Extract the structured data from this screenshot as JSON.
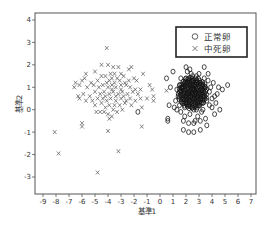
{
  "chart_data": {
    "type": "scatter",
    "title": "",
    "xlabel": "基準1",
    "ylabel": "基準2",
    "xlim": [
      -9.6,
      7.3
    ],
    "ylim": [
      -3.8,
      4.1
    ],
    "xticks": [
      -9,
      -8,
      -7,
      -6,
      -5,
      -4,
      -3,
      -2,
      -1,
      0,
      1,
      2,
      3,
      4,
      5,
      6,
      7
    ],
    "yticks": [
      4,
      3,
      2,
      1,
      0,
      -1,
      -2,
      -3
    ],
    "grid": false,
    "legend_position": "top-right",
    "series": [
      {
        "name": "正常卵",
        "marker": "circle",
        "color": "#1a1a1a",
        "points": [
          [
            2.2,
            0.8
          ],
          [
            2.5,
            0.7
          ],
          [
            2.8,
            0.9
          ],
          [
            2.0,
            0.6
          ],
          [
            2.4,
            1.0
          ],
          [
            2.6,
            0.5
          ],
          [
            3.0,
            0.7
          ],
          [
            1.9,
            0.9
          ],
          [
            2.3,
            0.4
          ],
          [
            2.7,
            1.1
          ],
          [
            2.1,
            1.2
          ],
          [
            3.2,
            0.9
          ],
          [
            1.8,
            0.5
          ],
          [
            2.9,
            0.3
          ],
          [
            2.5,
            1.3
          ],
          [
            3.4,
            0.6
          ],
          [
            1.6,
            0.8
          ],
          [
            2.2,
            0.2
          ],
          [
            3.1,
            1.2
          ],
          [
            2.0,
            1.4
          ],
          [
            2.6,
            0.0
          ],
          [
            3.5,
            1.0
          ],
          [
            1.5,
            1.1
          ],
          [
            2.4,
            1.6
          ],
          [
            3.3,
            0.3
          ],
          [
            1.7,
            0.3
          ],
          [
            2.8,
            1.5
          ],
          [
            3.6,
            0.4
          ],
          [
            1.4,
            0.6
          ],
          [
            2.3,
            -0.2
          ],
          [
            2.9,
            -0.3
          ],
          [
            3.8,
            0.8
          ],
          [
            1.3,
            0.9
          ],
          [
            2.1,
            1.7
          ],
          [
            3.7,
            1.3
          ],
          [
            1.6,
            1.4
          ],
          [
            2.7,
            -0.5
          ],
          [
            4.0,
            0.5
          ],
          [
            1.2,
            0.4
          ],
          [
            3.0,
            1.6
          ],
          [
            3.9,
            1.0
          ],
          [
            4.2,
            0.6
          ],
          [
            4.4,
            0.7
          ],
          [
            4.5,
            1.0
          ],
          [
            4.1,
            1.2
          ],
          [
            4.6,
            0.0
          ],
          [
            5.2,
            1.1
          ],
          [
            4.8,
            0.9
          ],
          [
            3.7,
            1.6
          ],
          [
            3.4,
            1.9
          ],
          [
            2.3,
            1.8
          ],
          [
            2.0,
            1.9
          ],
          [
            1.0,
            1.7
          ],
          [
            0.5,
            1.4
          ],
          [
            0.8,
            1.0
          ],
          [
            0.7,
            0.2
          ],
          [
            1.1,
            0.1
          ],
          [
            1.3,
            0.0
          ],
          [
            1.6,
            -0.1
          ],
          [
            1.9,
            -0.3
          ],
          [
            1.8,
            -0.5
          ],
          [
            2.2,
            -0.6
          ],
          [
            2.6,
            -0.6
          ],
          [
            3.1,
            -0.5
          ],
          [
            3.5,
            -0.4
          ],
          [
            3.2,
            -0.1
          ],
          [
            3.6,
            -0.7
          ],
          [
            3.1,
            -0.9
          ],
          [
            2.6,
            -1.0
          ],
          [
            2.2,
            -1.0
          ],
          [
            1.8,
            -0.9
          ],
          [
            0.6,
            -0.4
          ],
          [
            0.6,
            -0.5
          ],
          [
            4.0,
            0.1
          ],
          [
            3.8,
            0.2
          ],
          [
            4.3,
            0.3
          ],
          [
            4.2,
            -0.2
          ],
          [
            3.3,
            0.0
          ],
          [
            1.5,
            0.2
          ],
          [
            1.9,
            0.1
          ],
          [
            2.5,
            0.1
          ],
          [
            2.8,
            0.0
          ],
          [
            3.0,
            0.2
          ],
          [
            2.4,
            0.6
          ],
          [
            2.6,
            0.9
          ],
          [
            2.1,
            0.7
          ],
          [
            2.9,
            0.6
          ],
          [
            2.3,
            1.1
          ],
          [
            2.7,
            0.8
          ],
          [
            3.1,
            0.5
          ],
          [
            1.9,
            1.2
          ],
          [
            2.5,
            1.5
          ],
          [
            3.3,
            1.1
          ],
          [
            2.0,
            0.3
          ],
          [
            2.8,
            1.2
          ],
          [
            3.4,
            1.4
          ],
          [
            1.7,
            1.0
          ],
          [
            2.2,
            1.4
          ],
          [
            -1.7,
            -0.1
          ]
        ]
      },
      {
        "name": "中死卵",
        "marker": "x",
        "color": "#555555",
        "points": [
          [
            -4.1,
            2.75
          ],
          [
            -4.5,
            2.0
          ],
          [
            -4.0,
            2.0
          ],
          [
            -3.6,
            1.9
          ],
          [
            -3.2,
            1.9
          ],
          [
            -2.2,
            1.9
          ],
          [
            -2.4,
            1.8
          ],
          [
            -5.0,
            1.7
          ],
          [
            -3.8,
            1.6
          ],
          [
            -3.5,
            1.6
          ],
          [
            -3.0,
            1.6
          ],
          [
            -2.8,
            1.5
          ],
          [
            -1.3,
            1.6
          ],
          [
            -5.7,
            1.6
          ],
          [
            -6.0,
            1.3
          ],
          [
            -5.8,
            1.4
          ],
          [
            -4.5,
            1.5
          ],
          [
            -4.2,
            1.5
          ],
          [
            -3.9,
            1.3
          ],
          [
            -3.3,
            1.4
          ],
          [
            -2.0,
            1.4
          ],
          [
            -1.8,
            1.3
          ],
          [
            -6.5,
            1.2
          ],
          [
            -6.6,
            1.0
          ],
          [
            -6.2,
            1.1
          ],
          [
            -5.6,
            1.0
          ],
          [
            -5.1,
            1.1
          ],
          [
            -4.7,
            1.0
          ],
          [
            -4.4,
            1.1
          ],
          [
            -4.0,
            1.0
          ],
          [
            -3.7,
            1.1
          ],
          [
            -3.4,
            1.0
          ],
          [
            -3.0,
            1.1
          ],
          [
            -2.6,
            1.1
          ],
          [
            -2.3,
            1.0
          ],
          [
            -1.9,
            0.9
          ],
          [
            -1.5,
            0.9
          ],
          [
            -0.8,
            1.1
          ],
          [
            -5.9,
            0.7
          ],
          [
            -5.4,
            0.6
          ],
          [
            -5.0,
            0.8
          ],
          [
            -4.6,
            0.7
          ],
          [
            -4.3,
            0.8
          ],
          [
            -3.9,
            0.7
          ],
          [
            -3.6,
            0.8
          ],
          [
            -3.2,
            0.7
          ],
          [
            -2.9,
            0.8
          ],
          [
            -2.5,
            0.7
          ],
          [
            -2.1,
            0.8
          ],
          [
            -1.7,
            0.7
          ],
          [
            -6.2,
            0.5
          ],
          [
            -5.7,
            0.4
          ],
          [
            -5.2,
            0.4
          ],
          [
            -4.8,
            0.5
          ],
          [
            -4.4,
            0.5
          ],
          [
            -4.1,
            0.4
          ],
          [
            -3.8,
            0.5
          ],
          [
            -3.4,
            0.4
          ],
          [
            -3.0,
            0.5
          ],
          [
            -2.6,
            0.4
          ],
          [
            -2.3,
            0.5
          ],
          [
            -1.9,
            0.4
          ],
          [
            -1.5,
            0.5
          ],
          [
            -1.0,
            0.5
          ],
          [
            -0.5,
            0.6
          ],
          [
            -0.5,
            0.4
          ],
          [
            -0.6,
            0.9
          ],
          [
            -5.0,
            0.2
          ],
          [
            -4.5,
            0.3
          ],
          [
            -3.9,
            0.2
          ],
          [
            -3.5,
            0.2
          ],
          [
            -3.1,
            0.2
          ],
          [
            -2.7,
            0.3
          ],
          [
            -2.2,
            0.2
          ],
          [
            -1.4,
            0.1
          ],
          [
            -4.9,
            -0.1
          ],
          [
            -4.6,
            -0.1
          ],
          [
            -4.3,
            -0.1
          ],
          [
            -4.0,
            -0.2
          ],
          [
            -3.7,
            -0.3
          ],
          [
            -3.3,
            -0.1
          ],
          [
            -3.9,
            -0.4
          ],
          [
            -4.2,
            0.1
          ],
          [
            -3.6,
            0.0
          ],
          [
            -2.9,
            0.0
          ],
          [
            -3.7,
            1.4
          ],
          [
            -3.1,
            1.3
          ],
          [
            -2.7,
            1.2
          ],
          [
            -4.8,
            1.3
          ],
          [
            -4.1,
            1.2
          ],
          [
            -3.5,
            1.2
          ],
          [
            -2.4,
            1.3
          ],
          [
            -5.3,
            1.2
          ],
          [
            -6.3,
            0.6
          ],
          [
            -3.4,
            0.6
          ],
          [
            -2.8,
            0.6
          ],
          [
            -4.2,
            0.6
          ],
          [
            -3.7,
            0.9
          ],
          [
            -3.0,
            0.9
          ],
          [
            -8.1,
            -1.0
          ],
          [
            -7.8,
            -1.95
          ],
          [
            -6.0,
            -0.75
          ],
          [
            -6.0,
            -0.6
          ],
          [
            -4.0,
            -0.95
          ],
          [
            -3.2,
            -1.85
          ],
          [
            -4.8,
            -2.8
          ],
          [
            -1.4,
            -0.75
          ],
          [
            0.5,
            0.85
          ]
        ]
      }
    ]
  },
  "legend": {
    "items": [
      {
        "symbol": "○",
        "label": "正常卵"
      },
      {
        "symbol": "×",
        "label": "中死卵"
      }
    ]
  },
  "axes": {
    "x_label": "基準1",
    "y_label": "基準2"
  }
}
